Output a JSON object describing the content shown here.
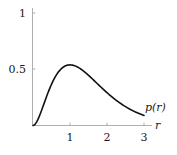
{
  "chart_data": {
    "type": "line",
    "title": "",
    "xlabel": "r",
    "ylabel": "",
    "series": [
      {
        "name": "p(r)",
        "x": [
          0,
          0.25,
          0.5,
          0.75,
          1.0,
          1.25,
          1.5,
          1.75,
          2.0,
          2.25,
          2.5,
          2.75,
          3.0
        ],
        "values": [
          0,
          0.152,
          0.368,
          0.502,
          0.541,
          0.513,
          0.448,
          0.37,
          0.293,
          0.225,
          0.168,
          0.124,
          0.089
        ]
      }
    ],
    "xticks": [
      "1",
      "2",
      "3"
    ],
    "yticks": [
      "0.5",
      "1"
    ],
    "xlim": [
      0,
      3.3
    ],
    "ylim": [
      0,
      1.05
    ],
    "grid": false,
    "annotations": [
      {
        "text": "p(r)",
        "x": 3.0,
        "y": 0.16
      }
    ]
  },
  "labels": {
    "x_axis": "r",
    "curve": "p(r)",
    "xtick_1": "1",
    "xtick_2": "2",
    "xtick_3": "3",
    "ytick_05": "0.5",
    "ytick_1": "1"
  }
}
